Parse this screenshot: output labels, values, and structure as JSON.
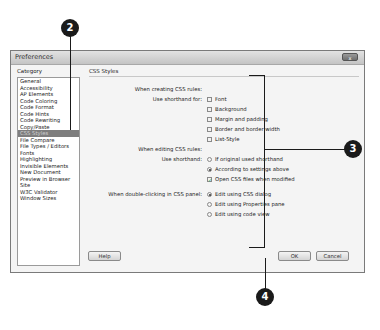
{
  "dialog": {
    "title": "Preferences",
    "close_label": "x",
    "category_label": "Category",
    "categories": [
      "General",
      "Accessibility",
      "AP Elements",
      "Code Coloring",
      "Code Format",
      "Code Hints",
      "Code Rewriting",
      "Copy/Paste",
      "CSS Styles",
      "File Compare",
      "File Types / Editors",
      "Fonts",
      "Highlighting",
      "Invisible Elements",
      "New Document",
      "Preview in Browser",
      "Site",
      "W3C Validator",
      "Window Sizes"
    ],
    "selected_category": "CSS Styles",
    "section_title": "CSS Styles",
    "creating": {
      "heading": "When creating CSS rules:",
      "shorthand_label": "Use shorthand for:",
      "options": [
        {
          "label": "Font",
          "checked": false
        },
        {
          "label": "Background",
          "checked": false
        },
        {
          "label": "Margin and padding",
          "checked": false
        },
        {
          "label": "Border and border width",
          "checked": false
        },
        {
          "label": "List-Style",
          "checked": false
        }
      ]
    },
    "editing": {
      "heading": "When editing CSS rules:",
      "shorthand_label": "Use shorthand:",
      "radios": [
        {
          "label": "If original used shorthand",
          "selected": false
        },
        {
          "label": "According to settings above",
          "selected": true
        }
      ],
      "open_files": {
        "label": "Open CSS files when modified",
        "checked": true
      }
    },
    "double_click": {
      "label": "When double-clicking in CSS panel:",
      "radios": [
        {
          "label": "Edit using CSS dialog",
          "selected": true
        },
        {
          "label": "Edit using Properties pane",
          "selected": false
        },
        {
          "label": "Edit using code view",
          "selected": false
        }
      ]
    },
    "buttons": {
      "help": "Help",
      "ok": "OK",
      "cancel": "Cancel"
    }
  },
  "callouts": {
    "two": "2",
    "three": "3",
    "four": "4"
  }
}
